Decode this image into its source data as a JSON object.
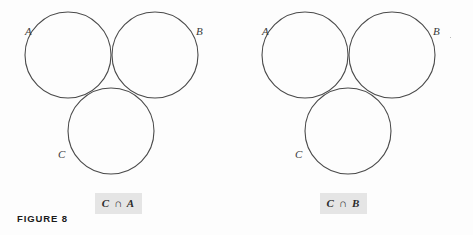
{
  "figure": {
    "label": "FIGURE 8",
    "background_color": "#fdfdfd",
    "stroke_color": "#4a4a4a",
    "shade_color": "#a9a9a9",
    "chip_background": "#e5e5e5"
  },
  "diagrams": [
    {
      "id": "venn-left",
      "caption": "C ∩ A",
      "shaded_region": "C ∩ A",
      "circles": [
        {
          "label": "A",
          "cx": 68,
          "cy": 55,
          "r": 43,
          "label_x": 25,
          "label_y": 35
        },
        {
          "label": "B",
          "cx": 155,
          "cy": 55,
          "r": 43,
          "label_x": 196,
          "label_y": 35
        },
        {
          "label": "C",
          "cx": 111,
          "cy": 131,
          "r": 43,
          "label_x": 58,
          "label_y": 158
        }
      ]
    },
    {
      "id": "venn-right",
      "caption": "C ∩ B",
      "shaded_region": "C ∩ B",
      "circles": [
        {
          "label": "A",
          "cx": 68,
          "cy": 55,
          "r": 43,
          "label_x": 25,
          "label_y": 35
        },
        {
          "label": "B",
          "cx": 155,
          "cy": 55,
          "r": 43,
          "label_x": 196,
          "label_y": 35
        },
        {
          "label": "C",
          "cx": 111,
          "cy": 131,
          "r": 43,
          "label_x": 58,
          "label_y": 158
        }
      ]
    }
  ]
}
